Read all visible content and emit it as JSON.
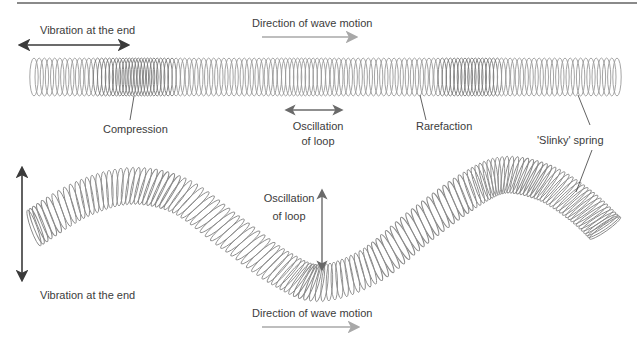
{
  "diagram": {
    "type": "slinky-wave-diagram",
    "colors": {
      "spring": "#9a9a9a",
      "spring_dark": "#6e6e6e",
      "arrow_dark": "#3a3a3a",
      "arrow_light": "#a8a8a8",
      "text": "#3c3c3c",
      "rule": "#8a8a8a"
    },
    "longitudinal": {
      "vibration_label": "Vibration at the end",
      "direction_label": "Direction of wave motion",
      "compression_label": "Compression",
      "oscillation_label_line1": "Oscillation",
      "oscillation_label_line2": "of loop",
      "rarefaction_label": "Rarefaction",
      "spring_label": "'Slinky' spring"
    },
    "transverse": {
      "vibration_label": "Vibration at the end",
      "direction_label": "Direction of wave motion",
      "oscillation_label_line1": "Oscillation",
      "oscillation_label_line2": "of loop"
    }
  }
}
